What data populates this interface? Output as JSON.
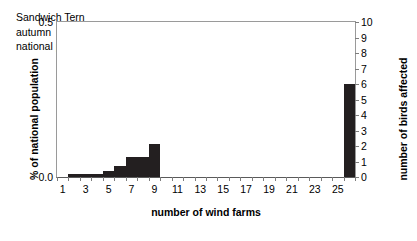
{
  "chart_data": {
    "type": "bar",
    "title": "",
    "annotation_lines": [
      "Sandwich Tern",
      "autumn",
      "national population size: 2,000"
    ],
    "species": "Sandwich Tern",
    "season": "autumn",
    "national_population_size": "2,000",
    "xlabel": "number of wind farms",
    "ylabel": "% of national population",
    "ylabel_right": "number of birds affected",
    "xlim": [
      1,
      27
    ],
    "ylim": [
      0.0,
      0.5
    ],
    "ylim_right": [
      0,
      10
    ],
    "grid": false,
    "legend": "none",
    "bar_color": "#231f20",
    "axis_color": "#9a9a9a",
    "x": [
      1,
      2,
      3,
      4,
      5,
      6,
      7,
      8,
      9,
      10,
      11,
      12,
      13,
      14,
      15,
      16,
      17,
      18,
      19,
      20,
      21,
      22,
      23,
      24,
      25,
      26
    ],
    "values_birds": [
      0,
      0.2,
      0.2,
      0.2,
      0.4,
      0.7,
      1.3,
      1.3,
      2.1,
      0,
      0,
      0,
      0,
      0,
      0,
      0,
      0,
      0,
      0,
      0,
      0,
      0,
      0,
      0,
      0,
      6.0
    ],
    "values_percent": [
      0.0,
      0.01,
      0.01,
      0.01,
      0.02,
      0.035,
      0.065,
      0.065,
      0.105,
      0.0,
      0.0,
      0.0,
      0.0,
      0.0,
      0.0,
      0.0,
      0.0,
      0.0,
      0.0,
      0.0,
      0.0,
      0.0,
      0.0,
      0.0,
      0.0,
      0.3
    ],
    "ytick_labels_left": [
      "0.5",
      "0.0"
    ],
    "ytick_values_left": [
      0.5,
      0.0
    ],
    "ytick_labels_right": [
      "10",
      "9",
      "8",
      "7",
      "6",
      "5",
      "4",
      "3",
      "2",
      "1",
      "0"
    ],
    "ytick_values_right": [
      10,
      9,
      8,
      7,
      6,
      5,
      4,
      3,
      2,
      1,
      0
    ],
    "xtick_labels": [
      "1",
      "3",
      "5",
      "7",
      "9",
      "11",
      "13",
      "15",
      "17",
      "19",
      "21",
      "23",
      "25"
    ],
    "xtick_values": [
      1,
      3,
      5,
      7,
      9,
      11,
      13,
      15,
      17,
      19,
      21,
      23,
      25
    ]
  }
}
